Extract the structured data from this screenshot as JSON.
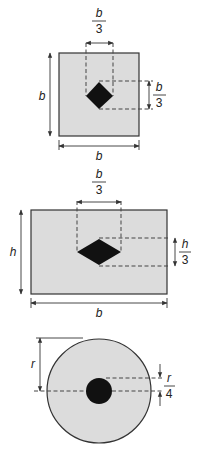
{
  "figures": [
    {
      "id": "square-section",
      "shape": "square",
      "hole": "diamond",
      "labels": {
        "height": "b",
        "width": "b",
        "hole_width_num": "b",
        "hole_width_den": "3",
        "hole_height_num": "b",
        "hole_height_den": "3"
      }
    },
    {
      "id": "rectangle-section",
      "shape": "rectangle",
      "hole": "diamond",
      "labels": {
        "height": "h",
        "width": "b",
        "hole_width_num": "b",
        "hole_width_den": "3",
        "hole_height_num": "h",
        "hole_height_den": "3"
      }
    },
    {
      "id": "circle-section",
      "shape": "circle",
      "hole": "circle",
      "labels": {
        "radius": "r",
        "offset_num": "r",
        "offset_den": "4"
      }
    }
  ],
  "colors": {
    "section_fill": "#dcdcdc",
    "hole_fill": "#111111",
    "line": "#333333"
  }
}
